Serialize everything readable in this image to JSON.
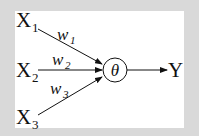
{
  "diagram": {
    "type": "perceptron",
    "inputs": [
      {
        "label": "X",
        "sub": "1"
      },
      {
        "label": "X",
        "sub": "2"
      },
      {
        "label": "X",
        "sub": "3"
      }
    ],
    "weights": [
      {
        "label": "w",
        "sub": "1"
      },
      {
        "label": "w",
        "sub": "2"
      },
      {
        "label": "w",
        "sub": "3"
      }
    ],
    "node": {
      "label": "θ"
    },
    "output": {
      "label": "Y"
    }
  },
  "colors": {
    "background": "#d9d9d9",
    "panel": "#ffffff",
    "ink": "#111111"
  }
}
